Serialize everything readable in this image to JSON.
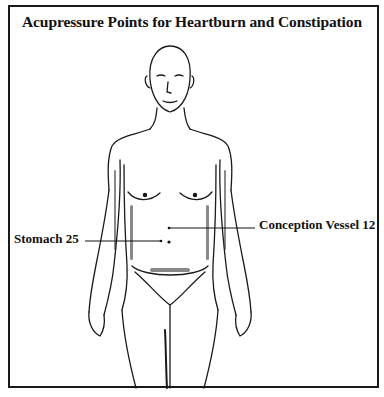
{
  "title": "Acupressure Points for Heartburn and Constipation",
  "points": [
    {
      "label": "Conception Vessel 12",
      "side": "right"
    },
    {
      "label": "Stomach 25",
      "side": "left"
    }
  ],
  "colors": {
    "ink": "#111111",
    "background": "#ffffff"
  }
}
